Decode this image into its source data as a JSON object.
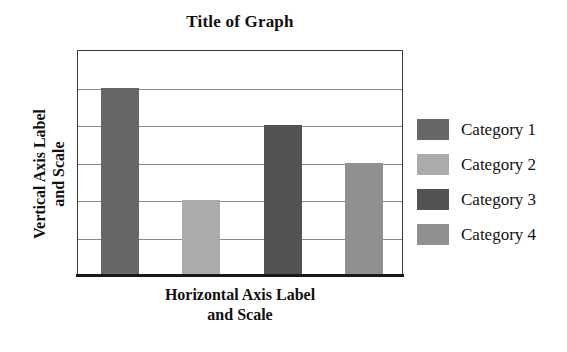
{
  "chart_data": {
    "type": "bar",
    "title": "Title of Graph",
    "xlabel_lines": [
      "Horizontal Axis Label",
      "and Scale"
    ],
    "ylabel_lines": [
      "Vertical Axis Label",
      "and Scale"
    ],
    "xlabel": "Horizontal Axis Label and Scale",
    "ylabel": "Vertical Axis Label and Scale",
    "categories": [
      "Category 1",
      "Category 2",
      "Category 3",
      "Category 4"
    ],
    "values": [
      5,
      2,
      4,
      3
    ],
    "ylim": [
      0,
      6
    ],
    "grid": true,
    "gridline_count": 5,
    "gridline_values": [
      1,
      2,
      3,
      4,
      5
    ],
    "legend_position": "right",
    "series": [
      {
        "name": "Category 1",
        "value": 5,
        "color": "#676767"
      },
      {
        "name": "Category 2",
        "value": 2,
        "color": "#ababab"
      },
      {
        "name": "Category 3",
        "value": 4,
        "color": "#535353"
      },
      {
        "name": "Category 4",
        "value": 3,
        "color": "#909090"
      }
    ],
    "axis_color": "#1a1a1a",
    "gridline_color": "#8a8a8a",
    "plot_background": "#ffffff"
  },
  "legend": {
    "items": [
      {
        "label": "Category 1",
        "color": "#676767"
      },
      {
        "label": "Category 2",
        "color": "#ababab"
      },
      {
        "label": "Category 3",
        "color": "#535353"
      },
      {
        "label": "Category 4",
        "color": "#909090"
      }
    ]
  }
}
